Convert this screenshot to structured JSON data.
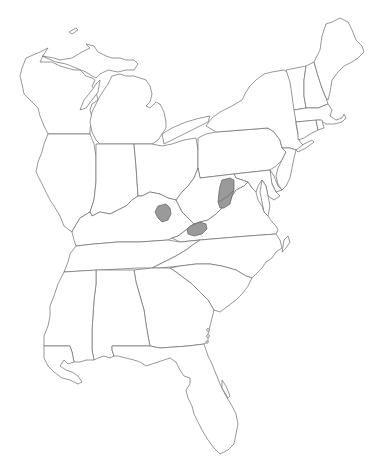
{
  "map": {
    "title": "",
    "region": "Eastern United States",
    "colors": {
      "background": "#ffffff",
      "state_outline": "#6b6b6b",
      "range_fill": "#9a9a9a"
    },
    "states": [
      "Wisconsin",
      "Michigan",
      "Illinois",
      "Indiana",
      "Ohio",
      "Kentucky",
      "Tennessee",
      "Mississippi",
      "Alabama",
      "Georgia",
      "Florida",
      "South Carolina",
      "North Carolina",
      "Virginia",
      "West Virginia",
      "Maryland",
      "Delaware",
      "New Jersey",
      "Pennsylvania",
      "New York",
      "Vermont",
      "New Hampshire",
      "Maine",
      "Massachusetts",
      "Connecticut",
      "Rhode Island"
    ],
    "shaded_regions": [
      {
        "name": "range-kentucky",
        "location": "east-central Kentucky"
      },
      {
        "name": "range-ky-va-border",
        "location": "southwest Virginia / eastern Kentucky"
      },
      {
        "name": "range-wv-va",
        "location": "West Virginia / Virginia highlands"
      }
    ]
  }
}
